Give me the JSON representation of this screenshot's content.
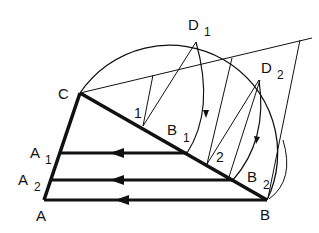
{
  "diagram": {
    "labels": {
      "C": "C",
      "A": "A",
      "A1_main": "A",
      "A1_sub": "1",
      "A2_main": "A",
      "A2_sub": "2",
      "B": "B",
      "B1_main": "B",
      "B1_sub": "1",
      "B2_main": "B",
      "B2_sub": "2",
      "D1_main": "D",
      "D1_sub": "1",
      "D2_main": "D",
      "D2_sub": "2",
      "p1": "1",
      "p2": "2"
    },
    "colors": {
      "stroke": "#111111",
      "background": "#ffffff"
    }
  }
}
